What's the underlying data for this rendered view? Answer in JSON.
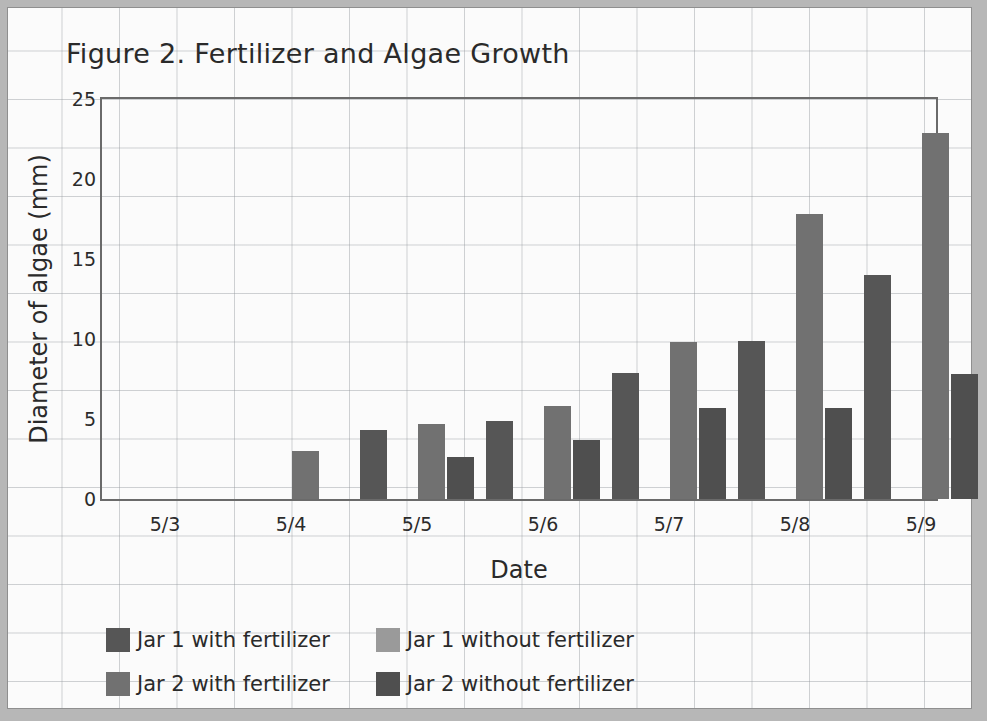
{
  "chart_data": {
    "type": "bar",
    "title": "Figure 2. Fertilizer and Algae Growth",
    "xlabel": "Date",
    "ylabel": "Diameter of algae (mm)",
    "categories": [
      "5/3",
      "5/4",
      "5/5",
      "5/6",
      "5/7",
      "5/8",
      "5/9"
    ],
    "ylim": [
      0,
      25
    ],
    "yticks": [
      0,
      5,
      10,
      15,
      20,
      25
    ],
    "grid": true,
    "legend_position": "below-plot",
    "series": [
      {
        "name": "Jar 1 with fertilizer",
        "color": "#565656",
        "values": [
          0,
          0,
          4.3,
          4.9,
          7.9,
          9.9,
          14.0
        ]
      },
      {
        "name": "Jar 1 without fertilizer",
        "color": "#9a9a9a",
        "values": [
          0,
          0,
          0,
          0,
          0,
          0,
          0
        ]
      },
      {
        "name": "Jar 2 with fertilizer",
        "color": "#717171",
        "values": [
          0,
          3.0,
          4.7,
          5.8,
          9.8,
          17.8,
          22.9
        ]
      },
      {
        "name": "Jar 2 without fertilizer",
        "color": "#4f4f4f",
        "values": [
          0,
          0,
          2.6,
          3.7,
          5.7,
          5.7,
          7.8
        ]
      }
    ]
  },
  "legend": {
    "items": [
      {
        "label": "Jar 1 with fertilizer",
        "color": "#565656"
      },
      {
        "label": "Jar 1 without fertilizer",
        "color": "#9a9a9a"
      },
      {
        "label": "Jar 2 with fertilizer",
        "color": "#717171"
      },
      {
        "label": "Jar 2 without fertilizer",
        "color": "#4f4f4f"
      }
    ]
  }
}
